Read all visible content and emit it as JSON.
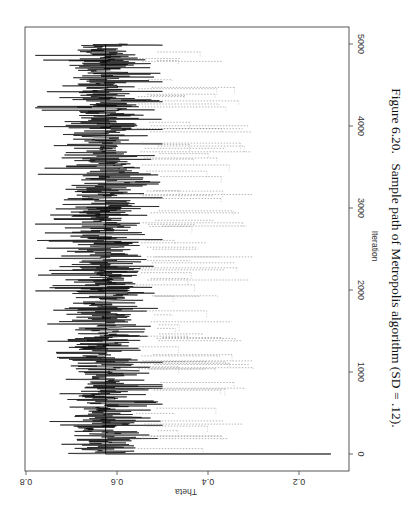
{
  "chart_data": {
    "type": "line",
    "title": "",
    "caption": {
      "prefix": "Figure 6.20.",
      "text": "Sample path of Metropolis algorithm (SD = .12)."
    },
    "xlabel": "Iteration",
    "ylabel": "Theta",
    "xlim": [
      0,
      5000
    ],
    "ylim": [
      0.15,
      0.8
    ],
    "x_ticks": [
      0,
      1000,
      2000,
      3000,
      4000,
      5000
    ],
    "x_tick_labels": [
      "0",
      "1000",
      "2000",
      "3000",
      "4000",
      "5000"
    ],
    "y_ticks": [
      0.2,
      0.4,
      0.6,
      0.8
    ],
    "y_tick_labels": [
      "0.2",
      "0.4",
      "0.6",
      "0.8"
    ],
    "grid": false,
    "orientation": "rotated 90 degrees clockwise on page",
    "series": [
      {
        "name": "sample path",
        "style": "solid",
        "color": "#000000",
        "start_value": 0.13,
        "mean": 0.625,
        "typical_range": [
          0.5,
          0.75
        ],
        "n_iterations": 5000
      },
      {
        "name": "rejected proposals",
        "style": "dotted",
        "color": "#888888",
        "typical_range": [
          0.3,
          0.5
        ]
      },
      {
        "name": "posterior mean",
        "style": "solid vertical reference",
        "color": "#000000",
        "value": 0.625
      }
    ]
  },
  "labels": {
    "caption_prefix": "Figure 6.20.",
    "caption_text": "Sample path of Metropolis algorithm (SD = .12).",
    "xlabel": "Iteration",
    "ylabel": "Theta"
  }
}
